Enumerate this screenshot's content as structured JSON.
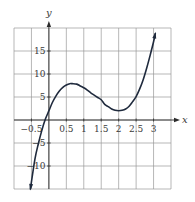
{
  "chart_data": {
    "type": "line",
    "title": "",
    "xlabel": "x",
    "ylabel": "y",
    "xlim": [
      -1,
      3.5
    ],
    "ylim": [
      -15,
      20
    ],
    "grid": true,
    "x_grid_step": 0.5,
    "y_grid_step": 5,
    "x_ticks": [
      {
        "value": -0.5,
        "label": "−0.5"
      },
      {
        "value": 0.5,
        "label": "0.5"
      },
      {
        "value": 1,
        "label": "1"
      },
      {
        "value": 1.5,
        "label": "1.5"
      },
      {
        "value": 2,
        "label": "2"
      },
      {
        "value": 2.5,
        "label": "2.5"
      },
      {
        "value": 3,
        "label": "3"
      }
    ],
    "y_ticks": [
      {
        "value": 15,
        "label": "15"
      },
      {
        "value": 10,
        "label": "10"
      },
      {
        "value": 5,
        "label": "5"
      },
      {
        "value": -5,
        "label": "−5"
      },
      {
        "value": -10,
        "label": "−10"
      }
    ],
    "series": [
      {
        "name": "f(x)",
        "color": "#1f2a3d",
        "arrows": "both",
        "x": [
          -0.53,
          -0.4,
          -0.3,
          -0.2,
          -0.1,
          0,
          0.1,
          0.2,
          0.3,
          0.4,
          0.5,
          0.6,
          0.67,
          0.8,
          0.9,
          1.0,
          1.1,
          1.2,
          1.3,
          1.4,
          1.5,
          1.6,
          1.7,
          1.8,
          1.9,
          2.0,
          2.1,
          2.2,
          2.3,
          2.4,
          2.5,
          2.6,
          2.7,
          2.8,
          2.9,
          3.0,
          3.05
        ],
        "values": [
          -15.0,
          -8.5,
          -5.1,
          -2.2,
          0.2,
          2.0,
          3.8,
          5.2,
          6.3,
          7.1,
          7.6,
          7.9,
          7.9,
          7.8,
          7.4,
          7.0,
          6.5,
          5.9,
          5.4,
          4.9,
          4.4,
          3.4,
          2.9,
          2.4,
          2.1,
          2.0,
          2.1,
          2.4,
          3.0,
          4.0,
          5.1,
          6.7,
          8.7,
          11.2,
          14.0,
          17.0,
          18.8
        ]
      }
    ],
    "key_points": {
      "local_max": {
        "x": 0.67,
        "y": 7.9
      },
      "local_min": {
        "x": 2,
        "y": 2
      },
      "y_intercept": {
        "x": 0,
        "y": 2
      }
    }
  }
}
